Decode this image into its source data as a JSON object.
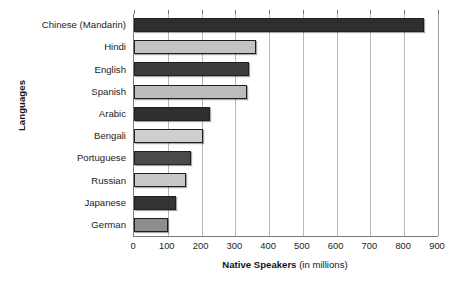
{
  "chart_data": {
    "type": "bar",
    "orientation": "horizontal",
    "title": "",
    "xlabel_bold": "Native Speakers",
    "xlabel_plain": "(in millions)",
    "ylabel": "Languages",
    "categories": [
      "Chinese (Mandarin)",
      "Hindi",
      "English",
      "Spanish",
      "Arabic",
      "Bengali",
      "Portuguese",
      "Russian",
      "Japanese",
      "German"
    ],
    "values": [
      860,
      360,
      340,
      335,
      225,
      205,
      170,
      155,
      125,
      100
    ],
    "xlim": [
      0,
      900
    ],
    "xticks": [
      0,
      100,
      200,
      300,
      400,
      500,
      600,
      700,
      800,
      900
    ],
    "xtick_labels": [
      "0",
      "100",
      "200",
      "300",
      "400",
      "500",
      "600",
      "700",
      "800",
      "900"
    ],
    "grid": "vertical",
    "legend": "none",
    "bar_colors": [
      "#2e2e2e",
      "#c3c3c3",
      "#3c3c3c",
      "#bcbcbc",
      "#2f2f2f",
      "#cfcfcf",
      "#4a4a4a",
      "#c9c9c9",
      "#343434",
      "#8e8e8e"
    ]
  },
  "colors": {
    "axis": "#7a7a7a",
    "gridline": "#b9b9b9",
    "text": "#1c1c1c",
    "background": "#ffffff"
  }
}
